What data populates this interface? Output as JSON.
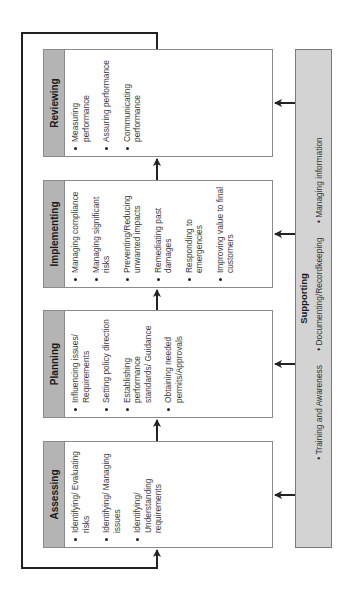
{
  "diagram": {
    "orientation": "rotated-90-ccw",
    "colors": {
      "header_fill": "#b4b4b4",
      "support_fill": "#d3d3d3",
      "box_border": "#8a8a8a",
      "line": "#222222"
    },
    "stages": [
      {
        "title": "Assessing",
        "items": [
          "Identifying/ Evaluating risks",
          "Identifying/ Managing issues",
          "Identifying/ Understanding requirements"
        ]
      },
      {
        "title": "Planning",
        "items": [
          "Influencing issues/ Requirements",
          "Setting policy direction",
          "Establishing performance standards/ Guidance",
          "Obtaining needed permits/Approvals"
        ]
      },
      {
        "title": "Implementing",
        "items": [
          "Managing compliance",
          "Managing significant risks",
          "Preventing/Reducing unwanted impacts",
          "Remediating past damages",
          "Responding to emergencies",
          "Improving value to final customers"
        ]
      },
      {
        "title": "Reviewing",
        "items": [
          "Measuring performance",
          "Assuring performance",
          "Communicating performance"
        ]
      }
    ],
    "supporting": {
      "title": "Supporting",
      "items": [
        "Training and Awareness",
        "Documenting/Recordkeeping",
        "Managing information"
      ]
    }
  }
}
